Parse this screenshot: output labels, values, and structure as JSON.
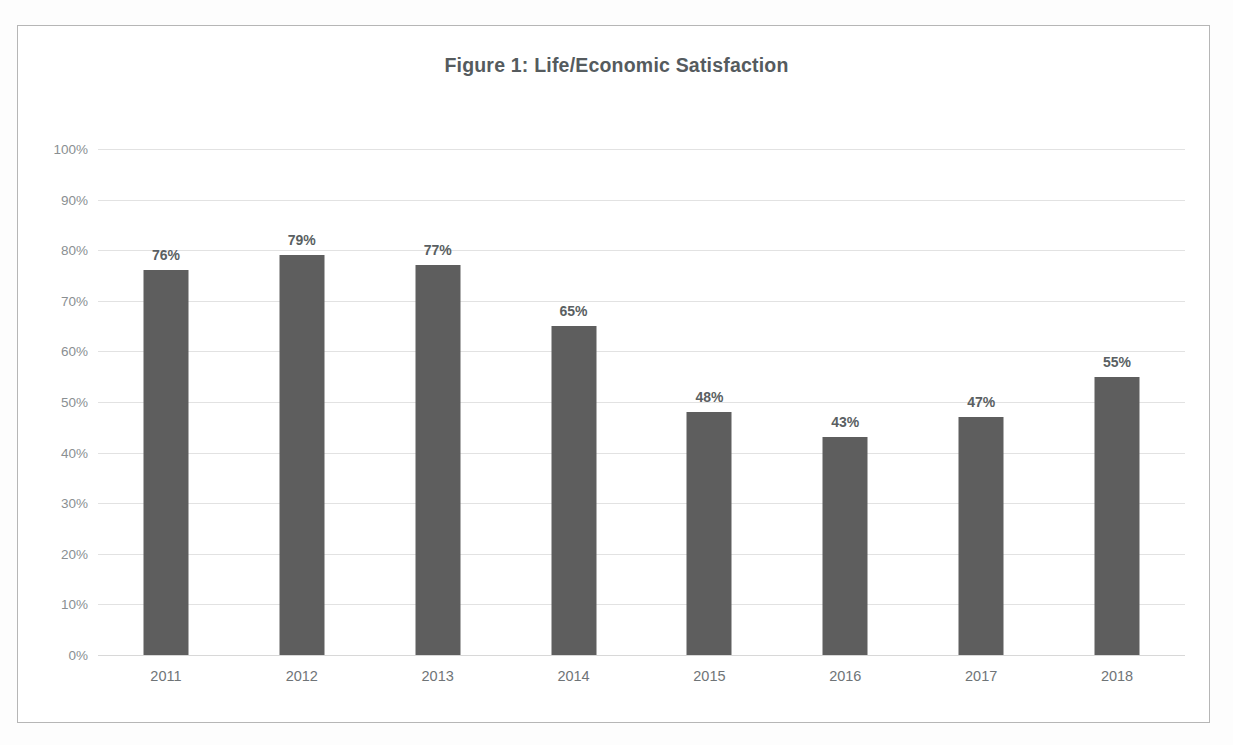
{
  "chart_data": {
    "type": "bar",
    "title": "Figure 1: Life/Economic Satisfaction",
    "xlabel": "",
    "ylabel": "",
    "categories": [
      "2011",
      "2012",
      "2013",
      "2014",
      "2015",
      "2016",
      "2017",
      "2018"
    ],
    "values": [
      76,
      79,
      77,
      65,
      48,
      43,
      47,
      55
    ],
    "value_labels": [
      "76%",
      "79%",
      "77%",
      "65%",
      "48%",
      "43%",
      "47%",
      "55%"
    ],
    "ylim": [
      0,
      100
    ],
    "ytick_values": [
      100,
      90,
      80,
      70,
      60,
      50,
      40,
      30,
      20,
      10,
      0
    ],
    "ytick_labels": [
      "100%",
      "90%",
      "80%",
      "70%",
      "60%",
      "50%",
      "40%",
      "30%",
      "20%",
      "10%",
      "0%"
    ],
    "grid": true,
    "legend": false,
    "legend_position": "none",
    "series_color": "#5e5e5e",
    "gridline_color": "#e2e2e2",
    "title_color": "#555b5e",
    "axis_label_color": "#8a8f92",
    "data_label_color": "#5a5f62",
    "plot_background": "#ffffff",
    "border_color": "#b6b6b6"
  }
}
